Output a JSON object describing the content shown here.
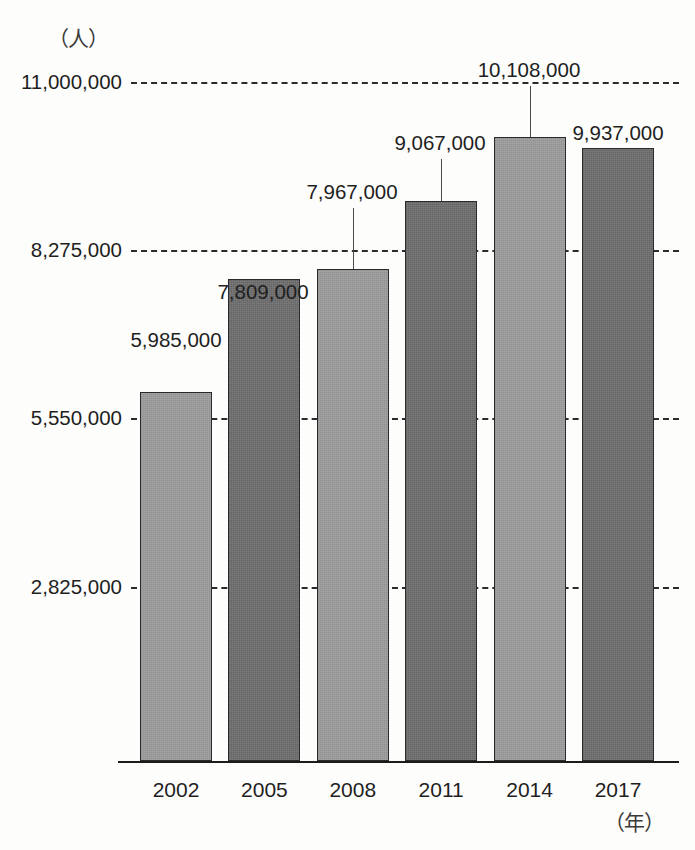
{
  "chart_data": {
    "type": "bar",
    "title": "",
    "subtitle": "",
    "xlabel": "（年）",
    "ylabel": "（人）",
    "categories": [
      "2002",
      "2005",
      "2008",
      "2011",
      "2014",
      "2017"
    ],
    "values": [
      5985000,
      7809000,
      7967000,
      9067000,
      10108000,
      9937000
    ],
    "value_labels": [
      "5,985,000",
      "7,809,000",
      "7,967,000",
      "9,067,000",
      "10,108,000",
      "9,937,000"
    ],
    "bar_shades": [
      "light",
      "dark",
      "light",
      "dark",
      "light",
      "dark"
    ],
    "ylim": [
      0,
      11000000
    ],
    "y_ticks": [
      2825000,
      5550000,
      8275000,
      11000000
    ],
    "y_tick_labels": [
      "2,825,000",
      "5,550,000",
      "8,275,000",
      "11,000,000"
    ],
    "grid": true,
    "grid_style": "dashed",
    "legend": "none",
    "colors": {
      "bar_light": "#9a9a9a",
      "bar_dark": "#6e6e6e",
      "bar_border": "#2a2a2a",
      "gridline": "#2b2b2b",
      "axis": "#1c1c1c",
      "text": "#1f1f1f",
      "background": "#fdfdfc"
    }
  },
  "axis": {
    "unit_person": "（人）",
    "unit_year": "（年）"
  }
}
